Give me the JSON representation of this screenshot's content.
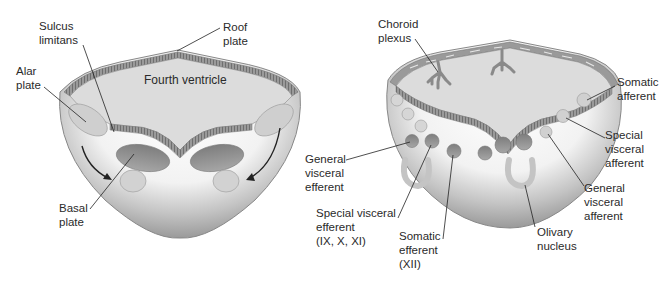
{
  "diagram": {
    "type": "embryology cross-section",
    "left_panel": {
      "ventricle_label": "Fourth ventricle",
      "labels": {
        "sulcus_limitans": "Sulcus\nlimitans",
        "roof_plate": "Roof\nplate",
        "alar_plate": "Alar\nplate",
        "basal_plate": "Basal\nplate"
      }
    },
    "right_panel": {
      "labels": {
        "choroid_plexus": "Choroid\nplexus",
        "somatic_afferent": "Somatic\nafferent",
        "special_visceral_afferent": "Special\nvisceral\nafferent",
        "general_visceral_afferent": "General\nvisceral\nafferent",
        "general_visceral_efferent": "General\nvisceral\nefferent",
        "special_visceral_efferent": "Special visceral\nefferent\n(IX, X, XI)",
        "somatic_efferent": "Somatic\nefferent\n(XII)",
        "olivary_nucleus": "Olivary\nnucleus"
      }
    },
    "colors": {
      "outer_tissue": "#a9a9a9",
      "inner_white": "#f4f4f4",
      "ventricle_fill": "#dcdcdc",
      "ependyma": "#8f8f8f",
      "nuclei": "#8a8a8a",
      "label_text": "#2a2a2a"
    }
  }
}
